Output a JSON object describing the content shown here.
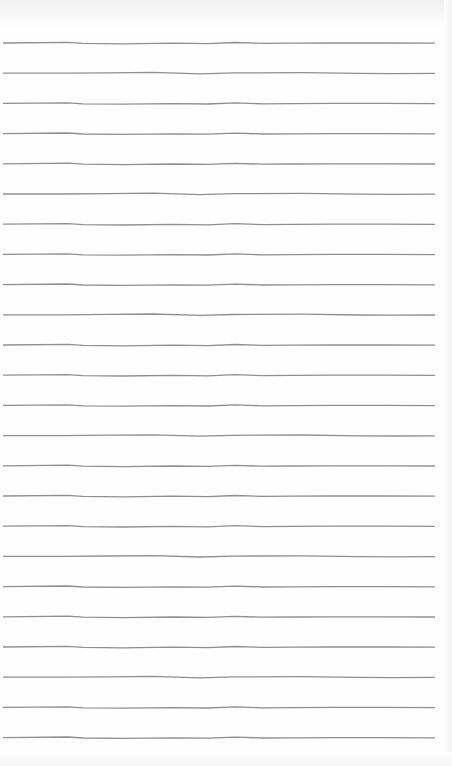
{
  "page": {
    "type": "lined-notebook-paper",
    "background_color": "#fefefe",
    "line_color": "#8f8f8f",
    "line_count": 24,
    "first_line_y": 43,
    "line_spacing": 30.2,
    "line_x_start": 3,
    "line_x_end": 435,
    "text_content": []
  }
}
